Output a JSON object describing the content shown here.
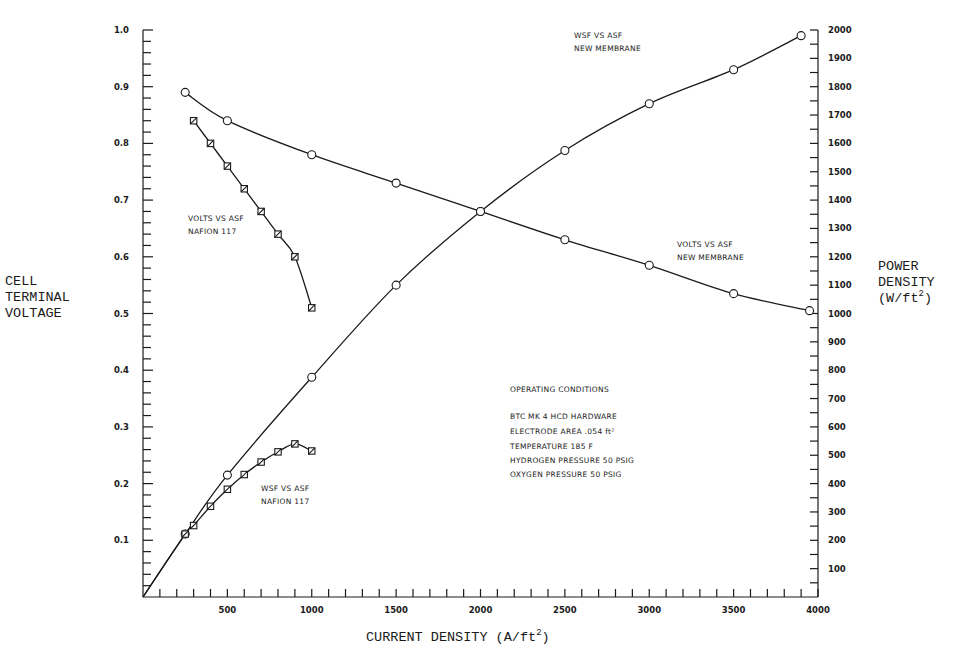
{
  "chart_data": {
    "type": "line",
    "title": "",
    "xlabel": "CURRENT DENSITY (A/ft",
    "xlabel_sup": "2",
    "xlabel_end": ")",
    "ylabel_left": [
      "CELL",
      "TERMINAL",
      "VOLTAGE"
    ],
    "ylabel_right": [
      "POWER",
      "DENSITY",
      "(W/ft"
    ],
    "ylabel_right_sup": "2",
    "ylabel_right_end": ")",
    "xlim": [
      0,
      4000
    ],
    "ylim_left": [
      0,
      1.0
    ],
    "ylim_right": [
      0,
      2000
    ],
    "grid": false,
    "x_ticks": [
      "500",
      "1000",
      "1500",
      "2000",
      "2500",
      "3000",
      "3500",
      "4000"
    ],
    "x_tick_values": [
      500,
      1000,
      1500,
      2000,
      2500,
      3000,
      3500,
      4000
    ],
    "y_left_ticks": [
      "0.1",
      "0.2",
      "0.3",
      "0.4",
      "0.5",
      "0.6",
      "0.7",
      "0.8",
      "0.9",
      "1.0"
    ],
    "y_left_tick_values": [
      0.1,
      0.2,
      0.3,
      0.4,
      0.5,
      0.6,
      0.7,
      0.8,
      0.9,
      1.0
    ],
    "y_right_ticks": [
      "100",
      "200",
      "300",
      "400",
      "500",
      "600",
      "700",
      "800",
      "900",
      "1000",
      "1100",
      "1200",
      "1300",
      "1400",
      "1500",
      "1600",
      "1700",
      "1800",
      "1900",
      "2000"
    ],
    "y_right_tick_values": [
      100,
      200,
      300,
      400,
      500,
      600,
      700,
      800,
      900,
      1000,
      1100,
      1200,
      1300,
      1400,
      1500,
      1600,
      1700,
      1800,
      1900,
      2000
    ],
    "series": [
      {
        "name": "VOLTS VS ASF NEW MEMBRANE",
        "axis": "left",
        "marker": "circle",
        "x": [
          250,
          500,
          1000,
          1500,
          2000,
          2500,
          3000,
          3500,
          3950
        ],
        "y": [
          0.89,
          0.84,
          0.78,
          0.73,
          0.68,
          0.63,
          0.585,
          0.535,
          0.505
        ],
        "label_lines": [
          "VOLTS VS ASF",
          "NEW MEMBRANE"
        ]
      },
      {
        "name": "VOLTS VS ASF NAFION 117",
        "axis": "left",
        "marker": "square",
        "x": [
          300,
          400,
          500,
          600,
          700,
          800,
          900,
          1000
        ],
        "y": [
          0.84,
          0.8,
          0.76,
          0.72,
          0.68,
          0.64,
          0.6,
          0.51
        ],
        "label_lines": [
          "VOLTS VS ASF",
          "NAFION 117"
        ]
      },
      {
        "name": "WSF VS ASF NEW MEMBRANE",
        "axis": "right",
        "marker": "circle",
        "x": [
          250,
          500,
          1000,
          1500,
          2000,
          2500,
          3000,
          3500,
          3900
        ],
        "y": [
          222,
          430,
          775,
          1100,
          1360,
          1575,
          1740,
          1860,
          1980
        ],
        "label_lines": [
          "WSF VS ASF",
          "NEW MEMBRANE"
        ]
      },
      {
        "name": "WSF VS ASF NAFION 117",
        "axis": "right",
        "marker": "square",
        "x": [
          250,
          300,
          400,
          500,
          600,
          700,
          800,
          900,
          1000
        ],
        "y": [
          222,
          252,
          320,
          380,
          432,
          476,
          512,
          540,
          515
        ],
        "label_lines": [
          "WSF VS ASF",
          "NAFION 117"
        ]
      }
    ],
    "annotations": {
      "operating_conditions_title": "OPERATING CONDITIONS",
      "lines": [
        "BTC MK 4 HCD HARDWARE",
        "ELECTRODE AREA  .054 ft²",
        "TEMPERATURE  185 F",
        "HYDROGEN PRESSURE  50 PSIG",
        "OXYGEN PRESSURE  50 PSIG"
      ]
    }
  }
}
